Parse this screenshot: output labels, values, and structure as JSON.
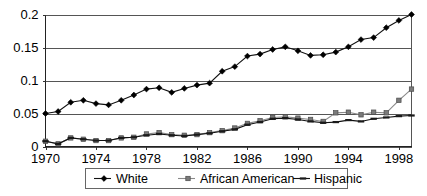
{
  "chart_data": {
    "type": "line",
    "title": "",
    "subtitle": "",
    "xlabel": "",
    "ylabel": "",
    "xlim": [
      1970,
      1999
    ],
    "ylim": [
      0,
      0.2
    ],
    "grid": "horizontal",
    "legend_position": "bottom",
    "x": [
      1970,
      1971,
      1972,
      1973,
      1974,
      1975,
      1976,
      1977,
      1978,
      1979,
      1980,
      1981,
      1982,
      1983,
      1984,
      1985,
      1986,
      1987,
      1988,
      1989,
      1990,
      1991,
      1992,
      1993,
      1994,
      1995,
      1996,
      1997,
      1998,
      1999
    ],
    "xticks": [
      1970,
      1974,
      1978,
      1982,
      1986,
      1990,
      1994,
      1998
    ],
    "xticklabels": [
      "1970",
      "1974",
      "1978",
      "1982",
      "1986",
      "1990",
      "1994",
      "1998"
    ],
    "yticks": [
      0,
      0.05,
      0.1,
      0.15,
      0.2
    ],
    "yticklabels": [
      "0",
      "0.05",
      "0.1",
      "0.15",
      "0.2"
    ],
    "series": [
      {
        "name": "White",
        "marker": "diamond",
        "color": "#000000",
        "values": [
          0.05,
          0.053,
          0.067,
          0.07,
          0.065,
          0.063,
          0.07,
          0.078,
          0.087,
          0.089,
          0.082,
          0.088,
          0.093,
          0.096,
          0.114,
          0.121,
          0.137,
          0.14,
          0.147,
          0.151,
          0.145,
          0.138,
          0.139,
          0.143,
          0.151,
          0.162,
          0.165,
          0.18,
          0.191,
          0.2
        ]
      },
      {
        "name": "African American",
        "marker": "square",
        "color": "#7a7a7a",
        "values": [
          0.008,
          0.004,
          0.013,
          0.011,
          0.009,
          0.009,
          0.013,
          0.014,
          0.019,
          0.021,
          0.018,
          0.017,
          0.018,
          0.021,
          0.024,
          0.028,
          0.035,
          0.039,
          0.044,
          0.045,
          0.043,
          0.041,
          0.038,
          0.051,
          0.052,
          0.048,
          0.052,
          0.051,
          0.07,
          0.087
        ]
      },
      {
        "name": "Hispanic",
        "marker": "dash",
        "color": "#1a1a1a",
        "values": [
          0.008,
          0.004,
          0.013,
          0.011,
          0.009,
          0.009,
          0.013,
          0.014,
          0.017,
          0.019,
          0.017,
          0.016,
          0.018,
          0.02,
          0.023,
          0.026,
          0.033,
          0.037,
          0.042,
          0.043,
          0.041,
          0.038,
          0.036,
          0.037,
          0.04,
          0.038,
          0.042,
          0.044,
          0.046,
          0.047
        ]
      }
    ]
  },
  "legend": {
    "items": [
      {
        "label": "White",
        "marker": "diamond"
      },
      {
        "label": "African American",
        "marker": "square"
      },
      {
        "label": "Hispanic",
        "marker": "dash"
      }
    ]
  },
  "colors": {
    "white_series": "#000000",
    "african_american_series": "#7a7a7a",
    "hispanic_series": "#1a1a1a",
    "grid": "#555555",
    "background": "#ffffff"
  }
}
